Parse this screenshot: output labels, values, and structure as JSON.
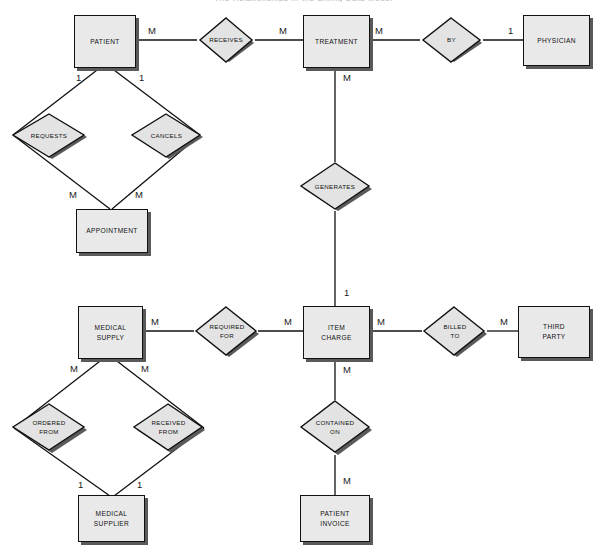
{
  "diagram": {
    "type": "entity-relationship-diagram",
    "notation": "Chen",
    "title_cropped": "The Relationships in the Billing Data Model",
    "colors": {
      "entity_fill": "#e9e9e9",
      "relationship_fill": "#e3e3e3",
      "stroke": "#111111",
      "shadow": "#5a5a5a",
      "background": "#ffffff"
    },
    "entities": [
      {
        "id": "patient",
        "label": "PATIENT"
      },
      {
        "id": "treatment",
        "label": "TREATMENT"
      },
      {
        "id": "physician",
        "label": "PHYSICIAN"
      },
      {
        "id": "appointment",
        "label": "APPOINTMENT"
      },
      {
        "id": "medical_supply",
        "label": "MEDICAL\nSUPPLY"
      },
      {
        "id": "item_charge",
        "label": "ITEM\nCHARGE"
      },
      {
        "id": "third_party",
        "label": "THIRD\nPARTY"
      },
      {
        "id": "medical_supplier",
        "label": "MEDICAL\nSUPPLIER"
      },
      {
        "id": "patient_invoice",
        "label": "PATIENT\nINVOICE"
      }
    ],
    "relationships": [
      {
        "id": "receives",
        "label": "RECEIVES",
        "from": "patient",
        "to": "treatment",
        "from_card": "M",
        "to_card": "M"
      },
      {
        "id": "by",
        "label": "BY",
        "from": "treatment",
        "to": "physician",
        "from_card": "M",
        "to_card": "1"
      },
      {
        "id": "requests",
        "label": "REQUESTS",
        "from": "patient",
        "to": "appointment",
        "from_card": "1",
        "to_card": "M"
      },
      {
        "id": "cancels",
        "label": "CANCELS",
        "from": "patient",
        "to": "appointment",
        "from_card": "1",
        "to_card": "M"
      },
      {
        "id": "generates",
        "label": "GENERATES",
        "from": "treatment",
        "to": "item_charge",
        "from_card": "M",
        "to_card": "1"
      },
      {
        "id": "required_for",
        "label": "REQUIRED\nFOR",
        "from": "medical_supply",
        "to": "item_charge",
        "from_card": "M",
        "to_card": "M"
      },
      {
        "id": "billed_to",
        "label": "BILLED\nTO",
        "from": "item_charge",
        "to": "third_party",
        "from_card": "M",
        "to_card": "M"
      },
      {
        "id": "ordered_from",
        "label": "ORDERED\nFROM",
        "from": "medical_supply",
        "to": "medical_supplier",
        "from_card": "M",
        "to_card": "1"
      },
      {
        "id": "received_from",
        "label": "RECEIVED\nFROM",
        "from": "medical_supply",
        "to": "medical_supplier",
        "from_card": "M",
        "to_card": "1"
      },
      {
        "id": "contained_on",
        "label": "CONTAINED\nON",
        "from": "item_charge",
        "to": "patient_invoice",
        "from_card": "M",
        "to_card": "M"
      }
    ],
    "cardinality_labels": [
      {
        "id": "c-patient-receives",
        "text": "M"
      },
      {
        "id": "c-receives-treatment",
        "text": "M"
      },
      {
        "id": "c-treatment-by",
        "text": "M"
      },
      {
        "id": "c-by-physician",
        "text": "1"
      },
      {
        "id": "c-patient-requests",
        "text": "1"
      },
      {
        "id": "c-patient-cancels",
        "text": "1"
      },
      {
        "id": "c-requests-appointment",
        "text": "M"
      },
      {
        "id": "c-cancels-appointment",
        "text": "M"
      },
      {
        "id": "c-treatment-generates",
        "text": "M"
      },
      {
        "id": "c-generates-itemcharge",
        "text": "1"
      },
      {
        "id": "c-medsupply-requiredfor",
        "text": "M"
      },
      {
        "id": "c-requiredfor-itemcharge",
        "text": "M"
      },
      {
        "id": "c-itemcharge-billedto",
        "text": "M"
      },
      {
        "id": "c-billedto-thirdparty",
        "text": "M"
      },
      {
        "id": "c-medsupply-orderedfrom",
        "text": "M"
      },
      {
        "id": "c-medsupply-receivedfrom",
        "text": "M"
      },
      {
        "id": "c-orderedfrom-supplier",
        "text": "1"
      },
      {
        "id": "c-receivedfrom-supplier",
        "text": "1"
      },
      {
        "id": "c-itemcharge-containedon",
        "text": "M"
      },
      {
        "id": "c-containedon-invoice",
        "text": "M"
      }
    ]
  }
}
